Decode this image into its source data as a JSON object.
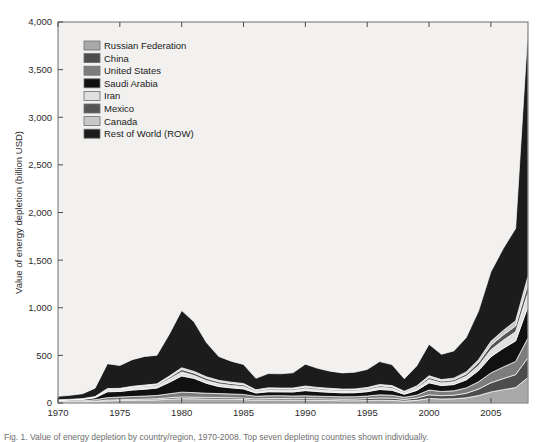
{
  "figure": {
    "plot": {
      "x": 58,
      "y": 22,
      "width": 470,
      "height": 381
    },
    "background": "#f2f1ef",
    "frame_color": "#6f6f6f",
    "caption": "Fig. 1. Value of energy depletion by country/region, 1970-2008. Top seven depleting countries shown individually."
  },
  "chart_data": {
    "type": "area",
    "stacked": true,
    "title": "",
    "xlabel": "",
    "ylabel": "Value of energy depletion (billion USD)",
    "xlim": [
      1970,
      2008
    ],
    "ylim": [
      0,
      4000
    ],
    "grid": false,
    "legend_position": "upper-left-inside",
    "xticks": [
      1970,
      1975,
      1980,
      1985,
      1990,
      1995,
      2000,
      2005
    ],
    "xtick_labels": [
      "1970",
      "1975",
      "1980",
      "1985",
      "1990",
      "1995",
      "2000",
      "2005"
    ],
    "yticks": [
      0,
      500,
      1000,
      1500,
      2000,
      2500,
      3000,
      3500,
      4000
    ],
    "ytick_labels": [
      "0",
      "500",
      "1,000",
      "1,500",
      "2,000",
      "2,500",
      "3,000",
      "3,500",
      "4,000"
    ],
    "x": [
      1970,
      1971,
      1972,
      1973,
      1974,
      1975,
      1976,
      1977,
      1978,
      1979,
      1980,
      1981,
      1982,
      1983,
      1984,
      1985,
      1986,
      1987,
      1988,
      1989,
      1990,
      1991,
      1992,
      1993,
      1994,
      1995,
      1996,
      1997,
      1998,
      1999,
      2000,
      2001,
      2002,
      2003,
      2004,
      2005,
      2006,
      2007,
      2008
    ],
    "series": [
      {
        "name": "Russian Federation",
        "color": "#a9a9a9",
        "values": [
          8,
          9,
          10,
          14,
          22,
          26,
          28,
          30,
          33,
          40,
          46,
          44,
          42,
          40,
          38,
          36,
          30,
          32,
          32,
          30,
          30,
          28,
          26,
          24,
          24,
          26,
          30,
          28,
          20,
          28,
          48,
          42,
          44,
          54,
          78,
          116,
          140,
          162,
          268
        ]
      },
      {
        "name": "China",
        "color": "#4d4d4d",
        "values": [
          3,
          3,
          4,
          5,
          8,
          9,
          10,
          11,
          12,
          15,
          18,
          17,
          17,
          17,
          17,
          16,
          13,
          14,
          15,
          15,
          16,
          16,
          16,
          16,
          17,
          20,
          23,
          23,
          18,
          24,
          38,
          35,
          38,
          48,
          68,
          96,
          116,
          136,
          208
        ]
      },
      {
        "name": "United States",
        "color": "#7d7d7d",
        "values": [
          10,
          11,
          12,
          16,
          26,
          28,
          30,
          32,
          34,
          42,
          50,
          48,
          44,
          42,
          40,
          38,
          28,
          30,
          30,
          29,
          30,
          28,
          26,
          25,
          25,
          27,
          33,
          31,
          22,
          30,
          50,
          44,
          46,
          56,
          76,
          104,
          122,
          138,
          208
        ]
      },
      {
        "name": "Saudi Arabia",
        "color": "#111111",
        "values": [
          7,
          9,
          12,
          20,
          62,
          58,
          68,
          72,
          78,
          120,
          170,
          150,
          104,
          74,
          64,
          58,
          34,
          42,
          40,
          42,
          54,
          48,
          44,
          42,
          42,
          46,
          56,
          52,
          32,
          50,
          76,
          62,
          66,
          84,
          118,
          170,
          196,
          216,
          330
        ]
      },
      {
        "name": "Iran",
        "color": "#e0e0e0",
        "values": [
          3,
          4,
          5,
          8,
          22,
          20,
          23,
          24,
          22,
          34,
          42,
          30,
          28,
          28,
          26,
          24,
          14,
          18,
          17,
          18,
          22,
          20,
          19,
          18,
          18,
          20,
          24,
          22,
          14,
          22,
          34,
          28,
          30,
          38,
          52,
          74,
          86,
          96,
          148
        ]
      },
      {
        "name": "Mexico",
        "color": "#555555",
        "values": [
          1,
          1,
          1,
          2,
          5,
          6,
          8,
          10,
          12,
          18,
          26,
          26,
          24,
          22,
          20,
          19,
          11,
          13,
          13,
          13,
          15,
          14,
          13,
          12,
          12,
          13,
          16,
          15,
          10,
          14,
          22,
          19,
          20,
          25,
          34,
          47,
          55,
          62,
          92
        ]
      },
      {
        "name": "Canada",
        "color": "#c8c8c8",
        "values": [
          2,
          2,
          2,
          3,
          7,
          7,
          8,
          9,
          10,
          14,
          18,
          17,
          16,
          15,
          14,
          14,
          9,
          10,
          10,
          10,
          11,
          10,
          10,
          9,
          10,
          11,
          13,
          12,
          8,
          11,
          18,
          16,
          17,
          21,
          29,
          40,
          47,
          53,
          80
        ]
      },
      {
        "name": "Rest of World (ROW)",
        "color": "#1c1c1c",
        "values": [
          36,
          42,
          52,
          88,
          260,
          240,
          280,
          300,
          300,
          440,
          600,
          520,
          360,
          250,
          220,
          200,
          120,
          150,
          150,
          160,
          230,
          200,
          180,
          170,
          175,
          190,
          240,
          220,
          130,
          210,
          330,
          265,
          285,
          360,
          510,
          730,
          860,
          970,
          2600
        ]
      }
    ]
  },
  "legend": {
    "items": [
      {
        "label": "Russian Federation",
        "color": "#a9a9a9"
      },
      {
        "label": "China",
        "color": "#4d4d4d"
      },
      {
        "label": "United States",
        "color": "#7d7d7d"
      },
      {
        "label": "Saudi Arabia",
        "color": "#111111"
      },
      {
        "label": "Iran",
        "color": "#e0e0e0"
      },
      {
        "label": "Mexico",
        "color": "#555555"
      },
      {
        "label": "Canada",
        "color": "#c8c8c8"
      },
      {
        "label": "Rest of World (ROW)",
        "color": "#1c1c1c"
      }
    ]
  }
}
